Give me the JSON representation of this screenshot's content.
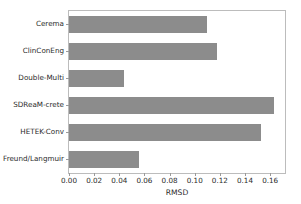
{
  "chart_data": {
    "type": "bar",
    "orientation": "horizontal",
    "title": "",
    "xlabel": "RMSD",
    "ylabel": "",
    "categories": [
      "Cerema",
      "ClinConEng",
      "Double-Multi",
      "SDReaM-crete",
      "HETEK-Conv",
      "Freund/Langmuir"
    ],
    "values": [
      0.11,
      0.118,
      0.044,
      0.163,
      0.153,
      0.056
    ],
    "xlim": [
      0.0,
      0.1718
    ],
    "xticks": [
      0.0,
      0.02,
      0.04,
      0.06,
      0.08,
      0.1,
      0.12,
      0.14,
      0.16
    ],
    "xtick_labels": [
      "0.00",
      "0.02",
      "0.04",
      "0.06",
      "0.08",
      "0.10",
      "0.12",
      "0.14",
      "0.16"
    ],
    "grid": false,
    "legend": null,
    "bar_color": "#8c8c8c",
    "axis_color": "#bcbcbc",
    "text_color": "#2b2b2b",
    "background": "#ffffff"
  }
}
